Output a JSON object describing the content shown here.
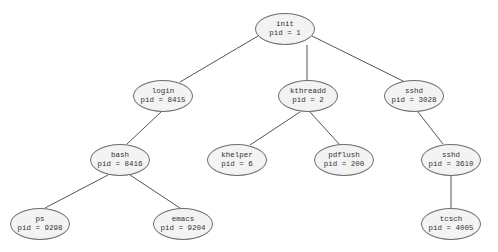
{
  "diagram": {
    "type": "tree",
    "title": "",
    "nodes": [
      {
        "id": "init",
        "name": "init",
        "pid_label": "pid = 1",
        "x": 285,
        "y": 29
      },
      {
        "id": "login",
        "name": "login",
        "pid_label": "pid = 8415",
        "x": 163,
        "y": 96
      },
      {
        "id": "kthreadd",
        "name": "kthreadd",
        "pid_label": "pid = 2",
        "x": 314,
        "y": 96
      },
      {
        "id": "sshd3028",
        "name": "sshd",
        "pid_label": "pid = 3028",
        "x": 420,
        "y": 96
      },
      {
        "id": "bash",
        "name": "bash",
        "pid_label": "pid = 8416",
        "x": 120,
        "y": 160
      },
      {
        "id": "khelper",
        "name": "khelper",
        "pid_label": "pid = 6",
        "x": 237,
        "y": 160
      },
      {
        "id": "pdflush",
        "name": "pdflush",
        "pid_label": "pid = 200",
        "x": 344,
        "y": 160
      },
      {
        "id": "sshd3610",
        "name": "sshd",
        "pid_label": "pid = 3610",
        "x": 451,
        "y": 160
      },
      {
        "id": "ps",
        "name": "ps",
        "pid_label": "pid = 9298",
        "x": 39,
        "y": 224
      },
      {
        "id": "emacs",
        "name": "emacs",
        "pid_label": "pid = 9204",
        "x": 183,
        "y": 224
      },
      {
        "id": "tcsch",
        "name": "tcsch",
        "pid_label": "pid = 4005",
        "x": 451,
        "y": 224
      }
    ],
    "edges": [
      [
        "init",
        "login"
      ],
      [
        "init",
        "kthreadd"
      ],
      [
        "init",
        "sshd3028"
      ],
      [
        "login",
        "bash"
      ],
      [
        "kthreadd",
        "khelper"
      ],
      [
        "kthreadd",
        "pdflush"
      ],
      [
        "sshd3028",
        "sshd3610"
      ],
      [
        "bash",
        "ps"
      ],
      [
        "bash",
        "emacs"
      ],
      [
        "sshd3610",
        "tcsch"
      ]
    ],
    "colors": {
      "edge": "#555555",
      "node_fill": "#f3f3f3",
      "node_border": "#6e6e6e",
      "text": "#333333"
    }
  }
}
